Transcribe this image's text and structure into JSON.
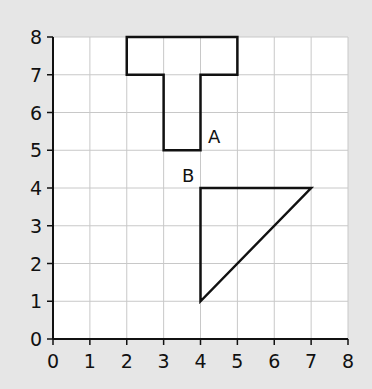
{
  "colors": {
    "background": "#e6e6e6",
    "plot_area": "#ffffff",
    "grid": "#c8c8c8",
    "axis": "#111111",
    "shape_stroke": "#111111"
  },
  "axes": {
    "x_ticks": [
      "0",
      "1",
      "2",
      "3",
      "4",
      "5",
      "6",
      "7",
      "8"
    ],
    "y_ticks": [
      "0",
      "1",
      "2",
      "3",
      "4",
      "5",
      "6",
      "7",
      "8"
    ],
    "xlim": [
      0,
      8
    ],
    "ylim": [
      0,
      8
    ]
  },
  "shapes": [
    {
      "name": "A",
      "label": "A",
      "type": "polygon",
      "points": [
        [
          2,
          8
        ],
        [
          5,
          8
        ],
        [
          5,
          7
        ],
        [
          4,
          7
        ],
        [
          4,
          5
        ],
        [
          3,
          5
        ],
        [
          3,
          7
        ],
        [
          2,
          7
        ]
      ],
      "label_pos": [
        4.2,
        5.2
      ]
    },
    {
      "name": "B",
      "label": "B",
      "type": "polygon",
      "points": [
        [
          4,
          4
        ],
        [
          7,
          4
        ],
        [
          4,
          1
        ]
      ],
      "label_pos": [
        3.5,
        4.15
      ]
    }
  ],
  "chart_data": {
    "type": "table",
    "title": "",
    "xlabel": "",
    "ylabel": "",
    "xlim": [
      0,
      8
    ],
    "ylim": [
      0,
      8
    ],
    "grid": true,
    "x_ticks": [
      0,
      1,
      2,
      3,
      4,
      5,
      6,
      7,
      8
    ],
    "y_ticks": [
      0,
      1,
      2,
      3,
      4,
      5,
      6,
      7,
      8
    ],
    "shapes": [
      {
        "label": "A",
        "shape": "T-shape",
        "vertices": [
          [
            2,
            8
          ],
          [
            5,
            8
          ],
          [
            5,
            7
          ],
          [
            4,
            7
          ],
          [
            4,
            5
          ],
          [
            3,
            5
          ],
          [
            3,
            7
          ],
          [
            2,
            7
          ]
        ]
      },
      {
        "label": "B",
        "shape": "right triangle",
        "vertices": [
          [
            4,
            4
          ],
          [
            7,
            4
          ],
          [
            4,
            1
          ]
        ]
      }
    ]
  }
}
